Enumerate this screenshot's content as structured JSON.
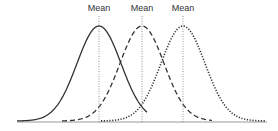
{
  "chart_data": {
    "type": "line",
    "title": "",
    "xlabel": "",
    "ylabel": "",
    "grid": false,
    "legend": null,
    "annotations": [
      "Mean",
      "Mean",
      "Mean"
    ],
    "series": [
      {
        "name": "solid curve",
        "style": "solid",
        "mean_x": 99,
        "peak": 1.0
      },
      {
        "name": "dashed curve",
        "style": "dashed",
        "mean_x": 142,
        "peak": 1.0
      },
      {
        "name": "dotted curve",
        "style": "dotted",
        "mean_x": 183,
        "peak": 1.0
      }
    ]
  },
  "labels": {
    "mean1": "Mean",
    "mean2": "Mean",
    "mean3": "Mean"
  },
  "colors": {
    "curve": "#333333",
    "axis": "#999999",
    "meanline": "#666666"
  }
}
